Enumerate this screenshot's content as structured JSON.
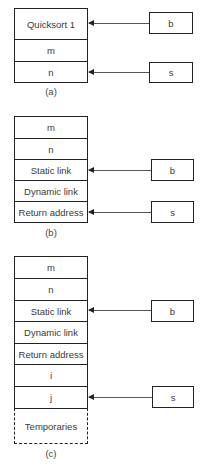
{
  "diagrams": [
    {
      "caption": "(a)",
      "top": 8,
      "cells": [
        {
          "label": "Quicksort 1",
          "top": 8,
          "height": 32
        },
        {
          "label": "m",
          "top": 39,
          "height": 23
        },
        {
          "label": "n",
          "top": 61,
          "height": 22
        }
      ],
      "pointers": [
        {
          "label": "b",
          "box": {
            "x": 149,
            "y": 12,
            "w": 44,
            "h": 22
          },
          "target_y": 23
        },
        {
          "label": "s",
          "box": {
            "x": 149,
            "y": 62,
            "w": 44,
            "h": 21
          },
          "target_y": 72
        }
      ],
      "caption_y": 86
    },
    {
      "caption": "(b)",
      "cells": [
        {
          "label": "m",
          "top": 116,
          "height": 23
        },
        {
          "label": "n",
          "top": 138,
          "height": 22
        },
        {
          "label": "Static link",
          "top": 159,
          "height": 22
        },
        {
          "label": "Dynamic link",
          "top": 180,
          "height": 22
        },
        {
          "label": "Return address",
          "top": 201,
          "height": 22
        }
      ],
      "pointers": [
        {
          "label": "b",
          "box": {
            "x": 151,
            "y": 159,
            "w": 43,
            "h": 22
          },
          "target_y": 170
        },
        {
          "label": "s",
          "box": {
            "x": 151,
            "y": 201,
            "w": 43,
            "h": 22
          },
          "target_y": 212
        }
      ],
      "caption_y": 227
    },
    {
      "caption": "(c)",
      "cells": [
        {
          "label": "m",
          "top": 256,
          "height": 23
        },
        {
          "label": "n",
          "top": 278,
          "height": 23
        },
        {
          "label": "Static link",
          "top": 300,
          "height": 22
        },
        {
          "label": "Dynamic link",
          "top": 321,
          "height": 23
        },
        {
          "label": "Return address",
          "top": 343,
          "height": 22
        },
        {
          "label": "i",
          "top": 364,
          "height": 23
        },
        {
          "label": "j",
          "top": 386,
          "height": 23
        },
        {
          "label": "Temporaries",
          "top": 408,
          "height": 36,
          "dashed": true
        }
      ],
      "pointers": [
        {
          "label": "b",
          "box": {
            "x": 151,
            "y": 300,
            "w": 43,
            "h": 22
          },
          "target_y": 310
        },
        {
          "label": "s",
          "box": {
            "x": 152,
            "y": 386,
            "w": 42,
            "h": 22
          },
          "target_y": 397
        }
      ],
      "caption_y": 448
    }
  ]
}
